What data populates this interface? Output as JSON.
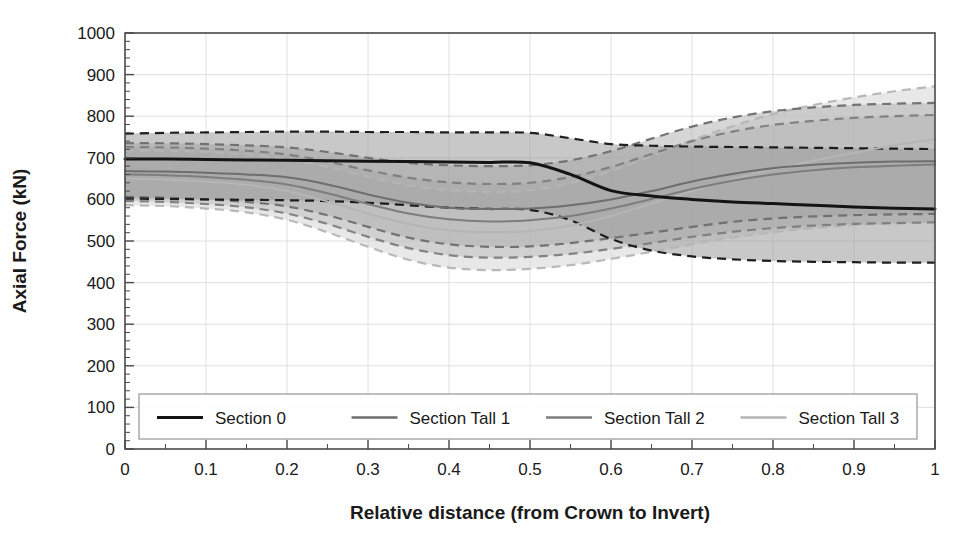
{
  "chart_data": {
    "type": "line",
    "title": "",
    "xlabel": "Relative distance (from Crown to Invert)",
    "ylabel": "Axial Force (kN)",
    "xlim": [
      0,
      1
    ],
    "ylim": [
      0,
      1000
    ],
    "xticks": [
      "0",
      "0.1",
      "0.2",
      "0.3",
      "0.4",
      "0.5",
      "0.6",
      "0.7",
      "0.8",
      "0.9",
      "1"
    ],
    "xtick_values": [
      0,
      0.1,
      0.2,
      0.3,
      0.4,
      0.5,
      0.6,
      0.7,
      0.8,
      0.9,
      1
    ],
    "yticks": [
      "0",
      "100",
      "200",
      "300",
      "400",
      "500",
      "600",
      "700",
      "800",
      "900",
      "1000"
    ],
    "ytick_values": [
      0,
      100,
      200,
      300,
      400,
      500,
      600,
      700,
      800,
      900,
      1000
    ],
    "minor_ticks_per_major": 5,
    "grid": true,
    "legend_position": "lower-center-inside",
    "x": [
      0,
      0.05,
      0.1,
      0.15,
      0.2,
      0.25,
      0.3,
      0.35,
      0.4,
      0.45,
      0.5,
      0.55,
      0.6,
      0.65,
      0.7,
      0.75,
      0.8,
      0.85,
      0.9,
      0.95,
      1
    ],
    "series": [
      {
        "name": "Section 0",
        "color": "#141414",
        "band_color": "#9a9a9a",
        "band_opacity": 0.55,
        "mean": [
          697,
          697,
          696,
          695,
          694,
          693,
          692,
          691,
          690,
          689,
          688,
          660,
          621,
          608,
          600,
          594,
          590,
          586,
          582,
          579,
          577
        ],
        "upper": [
          758,
          760,
          761,
          762,
          763,
          763,
          762,
          762,
          761,
          761,
          760,
          747,
          733,
          729,
          727,
          726,
          725,
          724,
          723,
          722,
          721
        ],
        "lower": [
          602,
          601,
          600,
          599,
          598,
          596,
          592,
          586,
          580,
          577,
          575,
          550,
          505,
          477,
          463,
          456,
          452,
          450,
          449,
          448,
          448
        ]
      },
      {
        "name": "Section Tall 1",
        "color": "#6e6e6e",
        "band_color": "#adadad",
        "band_opacity": 0.5,
        "mean": [
          668,
          667,
          664,
          660,
          653,
          636,
          612,
          592,
          580,
          577,
          578,
          586,
          600,
          620,
          643,
          661,
          675,
          683,
          688,
          691,
          692
        ],
        "upper": [
          735,
          735,
          733,
          730,
          725,
          714,
          700,
          688,
          682,
          680,
          682,
          694,
          716,
          746,
          775,
          797,
          812,
          821,
          827,
          830,
          832
        ],
        "lower": [
          606,
          604,
          600,
          594,
          583,
          562,
          534,
          508,
          492,
          486,
          487,
          495,
          507,
          520,
          534,
          546,
          554,
          559,
          562,
          564,
          565
        ]
      },
      {
        "name": "Section Tall 2",
        "color": "#7d7d7d",
        "band_color": "#b8b8b8",
        "band_opacity": 0.48,
        "mean": [
          660,
          658,
          654,
          647,
          636,
          615,
          589,
          566,
          552,
          547,
          550,
          560,
          578,
          601,
          625,
          645,
          660,
          670,
          677,
          681,
          684
        ],
        "upper": [
          726,
          725,
          722,
          717,
          708,
          691,
          670,
          652,
          641,
          637,
          640,
          654,
          678,
          709,
          740,
          763,
          779,
          789,
          796,
          800,
          803
        ],
        "lower": [
          596,
          594,
          589,
          581,
          566,
          541,
          510,
          483,
          466,
          460,
          462,
          469,
          481,
          495,
          510,
          522,
          531,
          537,
          541,
          543,
          545
        ]
      },
      {
        "name": "Section Tall 3",
        "color": "#b5b5b5",
        "band_color": "#d5d5d5",
        "band_opacity": 0.55,
        "mean": [
          650,
          648,
          643,
          635,
          620,
          595,
          566,
          541,
          526,
          521,
          524,
          537,
          560,
          590,
          620,
          648,
          672,
          693,
          712,
          730,
          745
        ],
        "upper": [
          718,
          717,
          714,
          708,
          697,
          678,
          654,
          634,
          622,
          618,
          622,
          639,
          668,
          704,
          742,
          776,
          805,
          827,
          845,
          860,
          872
        ],
        "lower": [
          586,
          584,
          578,
          569,
          551,
          521,
          486,
          455,
          436,
          430,
          433,
          442,
          457,
          474,
          492,
          508,
          521,
          531,
          538,
          543,
          547
        ]
      }
    ]
  },
  "legend": {
    "items": [
      {
        "label": "Section 0"
      },
      {
        "label": "Section Tall 1"
      },
      {
        "label": "Section Tall 2"
      },
      {
        "label": "Section Tall 3"
      }
    ]
  },
  "colors": {
    "axis": "#4a4a4a",
    "grid": "#d8d8d8",
    "text": "#1a1a1a",
    "background": "#ffffff"
  }
}
